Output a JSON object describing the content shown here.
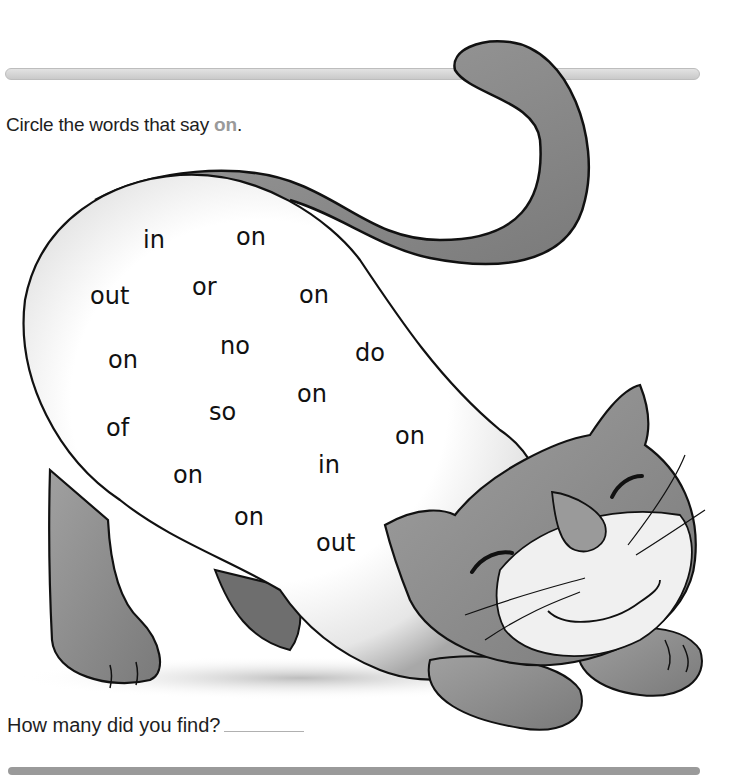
{
  "worksheet": {
    "instruction_prefix": "Circle the words that say ",
    "instruction_target": "on",
    "instruction_suffix": ".",
    "question": "How many did you find?",
    "answer_value": ""
  },
  "colors": {
    "target_word": "#9a9a9a",
    "cat_fill": "#8c8c8c",
    "cat_light": "#f2f2f2"
  },
  "words": [
    {
      "text": "in",
      "x": 143,
      "y": 228
    },
    {
      "text": "on",
      "x": 236,
      "y": 225
    },
    {
      "text": "out",
      "x": 90,
      "y": 284
    },
    {
      "text": "or",
      "x": 192,
      "y": 275
    },
    {
      "text": "on",
      "x": 299,
      "y": 283
    },
    {
      "text": "on",
      "x": 108,
      "y": 348
    },
    {
      "text": "no",
      "x": 220,
      "y": 334
    },
    {
      "text": "do",
      "x": 355,
      "y": 341
    },
    {
      "text": "on",
      "x": 297,
      "y": 382
    },
    {
      "text": "of",
      "x": 106,
      "y": 416
    },
    {
      "text": "so",
      "x": 209,
      "y": 400
    },
    {
      "text": "on",
      "x": 395,
      "y": 424
    },
    {
      "text": "in",
      "x": 318,
      "y": 453
    },
    {
      "text": "on",
      "x": 173,
      "y": 463
    },
    {
      "text": "on",
      "x": 234,
      "y": 505
    },
    {
      "text": "out",
      "x": 316,
      "y": 531
    }
  ]
}
